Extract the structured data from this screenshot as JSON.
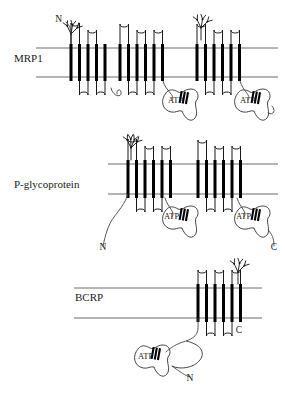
{
  "figure": {
    "background_color": "#ffffff",
    "ink_color": "#000000",
    "membrane_line_color": "#6b6b6b",
    "width": 285,
    "height": 399
  },
  "panels": [
    {
      "id": "mrp1",
      "label": "MRP1",
      "label_x": 14,
      "label_y": 62,
      "membrane_top_y": 48,
      "membrane_bottom_y": 77,
      "membrane_x_start": 36,
      "membrane_x_end": 278,
      "helix_groups": [
        {
          "start_x": 71,
          "count": 5,
          "pitch": 8.5,
          "loop_side": "top"
        },
        {
          "start_x": 120,
          "count": 6,
          "pitch": 8.5,
          "loop_side": "top"
        },
        {
          "start_x": 197,
          "count": 6,
          "pitch": 8.5,
          "loop_side": "top"
        }
      ],
      "glycans": [
        {
          "x": 71,
          "y": 34,
          "branches": 3
        },
        {
          "x": 201,
          "y": 28,
          "branches": 3
        }
      ],
      "nbds": [
        {
          "label": "ATP",
          "cx": 186,
          "cy": 101,
          "label_x": 168,
          "label_y": 103
        },
        {
          "label": "ATP",
          "cx": 258,
          "cy": 101,
          "label_x": 240,
          "label_y": 103
        }
      ],
      "termini": [
        {
          "label": "N",
          "x": 62,
          "y": 22,
          "anchor": "end"
        }
      ]
    },
    {
      "id": "pgp",
      "label": "P-glycoprotein",
      "label_x": 14,
      "label_y": 188,
      "membrane_top_y": 164,
      "membrane_bottom_y": 194,
      "membrane_x_start": 108,
      "membrane_x_end": 278,
      "helix_groups": [
        {
          "start_x": 128,
          "count": 6,
          "pitch": 8.5,
          "loop_side": "top"
        },
        {
          "start_x": 198,
          "count": 6,
          "pitch": 8.5,
          "loop_side": "top"
        }
      ],
      "glycans": [
        {
          "x": 131,
          "y": 148,
          "branches": 4
        }
      ],
      "nbds": [
        {
          "label": "ATP",
          "cx": 186,
          "cy": 218,
          "label_x": 164,
          "label_y": 219
        },
        {
          "label": "ATP",
          "cx": 258,
          "cy": 218,
          "label_x": 236,
          "label_y": 219
        }
      ],
      "termini": [
        {
          "label": "N",
          "x": 103,
          "y": 250,
          "anchor": "middle"
        },
        {
          "label": "C",
          "x": 274,
          "y": 250,
          "anchor": "middle"
        }
      ]
    },
    {
      "id": "bcrp",
      "label": "BCRP",
      "label_x": 75,
      "label_y": 301,
      "membrane_top_y": 288,
      "membrane_bottom_y": 318,
      "membrane_x_start": 74,
      "membrane_x_end": 262,
      "helix_groups": [
        {
          "start_x": 198,
          "count": 6,
          "pitch": 8.5,
          "loop_side": "top"
        }
      ],
      "glycans": [
        {
          "x": 238,
          "y": 272,
          "branches": 3
        }
      ],
      "nbds": [
        {
          "label": "ATP",
          "cx": 158,
          "cy": 357,
          "label_x": 138,
          "label_y": 359
        }
      ],
      "termini": [
        {
          "label": "C",
          "x": 239,
          "y": 333,
          "anchor": "middle"
        },
        {
          "label": "N",
          "x": 190,
          "y": 381,
          "anchor": "middle"
        }
      ]
    }
  ],
  "legend_terms": {
    "atp_label": "ATP",
    "n_terminus": "N",
    "c_terminus": "C"
  }
}
